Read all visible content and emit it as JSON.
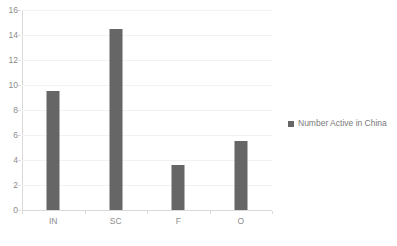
{
  "chart_data": {
    "type": "bar",
    "title": "Number Active in China",
    "xlabel": "",
    "ylabel": "",
    "categories": [
      "IN",
      "SC",
      "F",
      "O"
    ],
    "values": [
      9.5,
      14.5,
      3.6,
      5.5
    ],
    "series": [
      {
        "name": "Number Active in China",
        "values": [
          9.5,
          14.5,
          3.6,
          5.5
        ]
      }
    ],
    "ylim": [
      0,
      16
    ],
    "y_ticks": [
      0,
      2,
      4,
      6,
      8,
      10,
      12,
      14,
      16
    ],
    "y_tick_labels": [
      "0",
      "2",
      "4",
      "6",
      "8",
      "10",
      "12",
      "14",
      "16"
    ],
    "grid": true,
    "grid_axis": "y",
    "legend": {
      "entries": [
        "Number Active in China"
      ],
      "position": "right"
    },
    "colors": {
      "bar": "#666666",
      "gridline": "#f2f2f2",
      "axis": "#d9d9d9",
      "tick_label": "#8c8c8c",
      "legend_label": "#7a7a7a",
      "background": "#ffffff"
    }
  }
}
